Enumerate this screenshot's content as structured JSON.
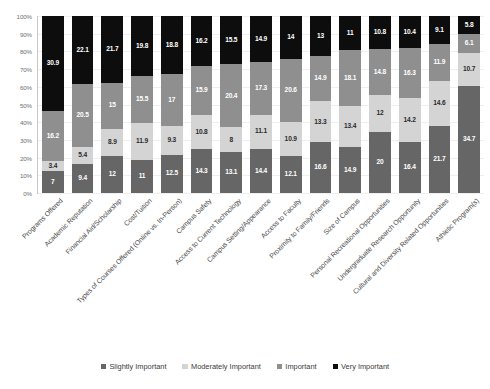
{
  "chart_data": {
    "type": "bar",
    "subtype": "stacked-100-percent",
    "title": "",
    "subtitle": "",
    "xlabel": "",
    "ylabel": "",
    "ylim": [
      0,
      100
    ],
    "y_tick_labels": [
      "100%",
      "90%",
      "80%",
      "70%",
      "60%",
      "50%",
      "40%",
      "30%",
      "20%",
      "10%",
      "0%"
    ],
    "y_tick_values": [
      100,
      90,
      80,
      70,
      60,
      50,
      40,
      30,
      20,
      10,
      0
    ],
    "grid": true,
    "legend_position": "bottom",
    "categories": [
      "Programs Offered",
      "Academic Reputation",
      "Financial Aid/Scholarship",
      "Cost/Tuition",
      "Types of Courses Offered (Online vs. In-Person)",
      "Campus Safety",
      "Access to Current Technology",
      "Campus Setting/Appearance",
      "Access to Faculty",
      "Proximity to Family/Friends",
      "Size of Campus",
      "Personal Recreational Opportunities",
      "Undergraduate Research Opportunity",
      "Cultural and Diversity Related Opportunities",
      "Athletic Program(s)"
    ],
    "series": [
      {
        "name": "Slightly Important",
        "color": "#666666",
        "values": [
          7,
          9.4,
          12,
          11,
          12.5,
          14.3,
          13.1,
          14.4,
          12.1,
          16.6,
          14.9,
          20,
          16.4,
          21.7,
          34.7
        ]
      },
      {
        "name": "Moderately Important",
        "color": "#d4d4d4",
        "values": [
          3.4,
          5.4,
          8.9,
          11.9,
          9.3,
          10.8,
          8,
          11.1,
          10.9,
          13.3,
          13.4,
          12,
          14.2,
          14.6,
          10.7
        ]
      },
      {
        "name": "Important",
        "color": "#8f8f8f",
        "values": [
          16.2,
          20.5,
          15,
          15.5,
          17,
          15.9,
          20.4,
          17.3,
          20.6,
          14.9,
          18.1,
          14.8,
          16.3,
          11.9,
          6.1
        ]
      },
      {
        "name": "Very Important",
        "color": "#0d0d0d",
        "values": [
          30.9,
          22.1,
          21.7,
          19.8,
          18.8,
          16.2,
          15.5,
          14.9,
          14,
          13,
          11,
          10.8,
          10.4,
          9.1,
          5.8
        ]
      }
    ]
  }
}
